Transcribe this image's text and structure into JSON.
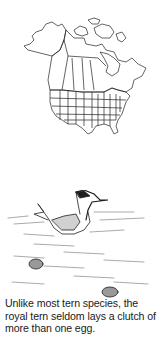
{
  "range_map": {
    "label": "North America range map",
    "line_color": "#222222"
  },
  "illustration": {
    "label": "Royal tern on nest with eggs",
    "ink_color": "#1e1e1e"
  },
  "caption": {
    "text": "Unlike most tern species, the royal tern seldom lays a clutch of more than one egg."
  }
}
